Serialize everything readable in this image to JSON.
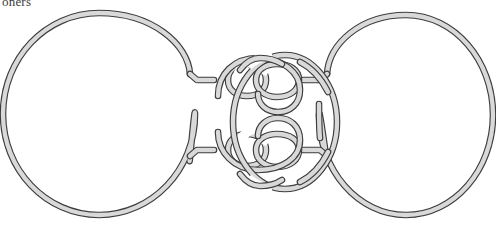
{
  "page": {
    "kind": "knot-theory-figure",
    "width": 496,
    "height": 225,
    "background_color": "#ffffff",
    "cut_off_text_line": "oners",
    "caption": ""
  },
  "style": {
    "rope_outline_color": "#3d3d3d",
    "rope_fill_color": "#d9d9d9",
    "rope_total_width_px": 6.6,
    "rope_fill_width_px": 4.3,
    "background_color": "#ffffff"
  },
  "figure": {
    "components": [
      {
        "name": "left-circle",
        "type": "circle",
        "center": [
          99,
          114
        ],
        "radius_x": 96,
        "radius_y": 101,
        "bbox": [
          3,
          13,
          195,
          215
        ]
      },
      {
        "name": "right-circle",
        "type": "circle",
        "center": [
          406,
          115
        ],
        "radius_x": 87,
        "radius_y": 100,
        "bbox": [
          319,
          15,
          493,
          215
        ]
      },
      {
        "name": "center-oval-loop",
        "type": "oval",
        "center": [
          285,
          122
        ],
        "radius_x": 52,
        "radius_y": 67,
        "bbox": [
          233,
          55,
          337,
          189
        ]
      },
      {
        "name": "upper-clasp",
        "type": "clasp-tangle",
        "bbox": [
          198,
          60,
          320,
          120
        ],
        "connector_kink_left": [
          201,
          78
        ],
        "connector_kink_right": [
          318,
          78
        ]
      },
      {
        "name": "lower-clasp",
        "type": "clasp-tangle",
        "bbox": [
          198,
          128,
          320,
          190
        ],
        "connector_kink_left": [
          201,
          152
        ],
        "connector_kink_right": [
          318,
          152
        ]
      }
    ],
    "crossing_count_visible": 18
  },
  "paths": {
    "left_circle": "M 192 78 C 196 48 160 15 99 14 C 42 14 4 62 4 114 C 4 166 42 214 99 214 C 156 214 194 166 194 114 C 194 104 189 176 192 152",
    "right_circle": "M 322 78 C 318 48 352 16 406 16 C 456 16 492 62 492 115 C 492 168 456 214 406 214 C 356 214 320 168 320 115 C 320 104 325 178 322 152",
    "center_oval": "M 285 55 C 313 55 337 85 337 122 C 337 159 313 189 285 189 C 257 189 233 159 233 122 C 233 85 257 55 285 55"
  }
}
